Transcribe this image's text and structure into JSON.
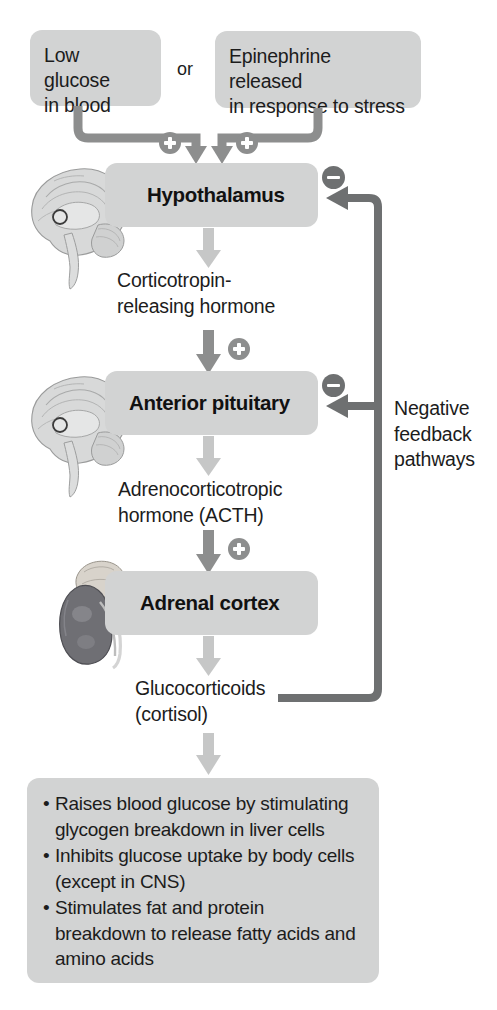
{
  "diagram": {
    "stimuli": {
      "left_box": "Low glucose\nin blood",
      "left_box_line1": "Low glucose",
      "left_box_line2": "in blood",
      "conjunction": "or",
      "right_box_line1": "Epinephrine released",
      "right_box_line2": "in response to stress"
    },
    "stages": [
      {
        "label": "Hypothalamus",
        "organ_icon": "brain-sagittal-icon"
      },
      {
        "label": "Anterior pituitary",
        "organ_icon": "brain-sagittal-icon"
      },
      {
        "label": "Adrenal cortex",
        "organ_icon": "kidney-adrenal-icon"
      }
    ],
    "hormones": [
      {
        "line1": "Corticotropin-",
        "line2": "releasing hormone"
      },
      {
        "line1": "Adrenocorticotropic",
        "line2": "hormone (ACTH)"
      },
      {
        "line1": "Glucocorticoids",
        "line2": "(cortisol)"
      }
    ],
    "feedback": {
      "line1": "Negative",
      "line2": "feedback",
      "line3": "pathways",
      "sign": "minus"
    },
    "signs": {
      "plus": "+",
      "minus": "–",
      "plus_count": 3,
      "minus_count": 2
    },
    "effects": [
      "Raises blood glucose by stimulating glycogen breakdown in liver cells",
      "Inhibits glucose uptake by body cells (except in CNS)",
      "Stimulates fat and protein breakdown to release fatty acids and amino acids"
    ],
    "effects_lines": [
      [
        "Raises blood glucose by stimulating",
        "glycogen breakdown in liver cells"
      ],
      [
        "Inhibits glucose uptake by body cells",
        "(except in CNS)"
      ],
      [
        "Stimulates fat and protein",
        "breakdown to release fatty acids and",
        "amino acids"
      ]
    ],
    "bullet_char": "•",
    "colors": {
      "box_fill": "#d2d3d3",
      "arrow_light": "#c6c7c7",
      "connector_gray": "#8d8e8e",
      "feedback_dark": "#6e7071",
      "text": "#1c1c1c",
      "background": "#ffffff"
    }
  }
}
